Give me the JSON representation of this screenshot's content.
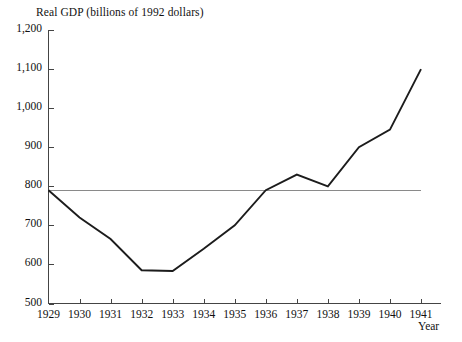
{
  "chart_data": {
    "type": "line",
    "title": "Real GDP (billions of 1992 dollars)",
    "xlabel": "Year",
    "ylabel": "",
    "x": [
      1929,
      1930,
      1931,
      1932,
      1933,
      1934,
      1935,
      1936,
      1937,
      1938,
      1939,
      1940,
      1941
    ],
    "categories": [
      "1929",
      "1930",
      "1931",
      "1932",
      "1933",
      "1934",
      "1935",
      "1936",
      "1937",
      "1938",
      "1939",
      "1940",
      "1941"
    ],
    "values": [
      790,
      720,
      665,
      585,
      583,
      640,
      700,
      790,
      830,
      800,
      900,
      945,
      1100
    ],
    "series": [
      {
        "name": "Real GDP",
        "values": [
          790,
          720,
          665,
          585,
          583,
          640,
          700,
          790,
          830,
          800,
          900,
          945,
          1100
        ],
        "color": "#1c1c1c"
      }
    ],
    "xlim": [
      1929,
      1941
    ],
    "ylim": [
      500,
      1200
    ],
    "yticks": [
      500,
      600,
      700,
      800,
      900,
      1000,
      1100,
      1200
    ],
    "ytick_labels": [
      "500",
      "600",
      "700",
      "800",
      "900",
      "1,000",
      "1,100",
      "1,200"
    ],
    "xticks": [
      1929,
      1930,
      1931,
      1932,
      1933,
      1934,
      1935,
      1936,
      1937,
      1938,
      1939,
      1940,
      1941
    ],
    "xtick_labels": [
      "1929",
      "1930",
      "1931",
      "1932",
      "1933",
      "1934",
      "1935",
      "1936",
      "1937",
      "1938",
      "1939",
      "1940",
      "1941"
    ],
    "grid": false,
    "legend": null,
    "annotations": [
      {
        "name": "reference-line-1929-level",
        "type": "hline",
        "value": 790,
        "x_start": 1929,
        "x_end": 1941,
        "color": "#8a8a8a"
      }
    ]
  },
  "axes": {
    "axis_color": "#444444",
    "background": "#ffffff"
  }
}
